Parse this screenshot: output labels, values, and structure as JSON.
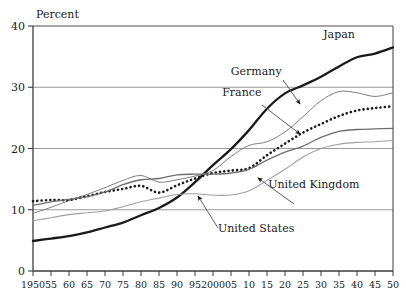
{
  "chart_data": {
    "type": "line",
    "title": "",
    "ylabel": "Percent",
    "xlabel": "",
    "ylim": [
      0,
      40
    ],
    "xlim": [
      1950,
      2050
    ],
    "yticks": [
      "0",
      "10",
      "20",
      "30",
      "40"
    ],
    "ytick_values": [
      0,
      10,
      20,
      30,
      40
    ],
    "grid": "horizontal gridlines at 10, 20, 30",
    "legend_position": "inline annotations with leader arrows",
    "xticks": [
      "1950",
      "55",
      "60",
      "65",
      "70",
      "75",
      "80",
      "85",
      "90",
      "95",
      "2000",
      "05",
      "10",
      "15",
      "20",
      "25",
      "30",
      "35",
      "40",
      "45",
      "50"
    ],
    "xtick_values": [
      1950,
      1955,
      1960,
      1965,
      1970,
      1975,
      1980,
      1985,
      1990,
      1995,
      2000,
      2005,
      2010,
      2015,
      2020,
      2025,
      2030,
      2035,
      2040,
      2045,
      2050
    ],
    "x": [
      1950,
      1955,
      1960,
      1965,
      1970,
      1975,
      1980,
      1985,
      1990,
      1995,
      2000,
      2005,
      2010,
      2015,
      2020,
      2025,
      2030,
      2035,
      2040,
      2045,
      2050
    ],
    "series": [
      {
        "name": "Japan",
        "style": "solid-thick-black",
        "color": "#1a1a1a",
        "values": [
          4.9,
          5.3,
          5.7,
          6.3,
          7.1,
          7.9,
          9.1,
          10.3,
          12.0,
          14.5,
          17.3,
          19.9,
          23.0,
          26.5,
          29.0,
          30.3,
          31.7,
          33.4,
          34.9,
          35.5,
          36.5
        ]
      },
      {
        "name": "Germany",
        "style": "solid-thin-gray",
        "color": "#808080",
        "values": [
          9.4,
          10.4,
          11.5,
          12.5,
          13.6,
          14.8,
          15.6,
          14.5,
          14.9,
          15.5,
          16.4,
          18.7,
          20.5,
          21.1,
          22.7,
          25.2,
          27.8,
          29.3,
          29.1,
          28.5,
          29.1
        ]
      },
      {
        "name": "France",
        "style": "dotted-black",
        "color": "#1a1a1a",
        "values": [
          11.4,
          11.6,
          11.6,
          12.2,
          12.9,
          13.4,
          13.9,
          12.8,
          14.0,
          15.1,
          16.0,
          16.4,
          16.8,
          18.9,
          20.8,
          22.6,
          24.0,
          25.3,
          26.2,
          26.6,
          26.9
        ]
      },
      {
        "name": "United Kingdom",
        "style": "solid-medium-gray",
        "color": "#6e6e6e",
        "values": [
          10.7,
          11.3,
          11.7,
          12.1,
          12.9,
          14.1,
          14.9,
          15.1,
          15.7,
          15.8,
          15.8,
          16.0,
          16.6,
          18.1,
          19.4,
          20.4,
          21.8,
          22.8,
          23.1,
          23.2,
          23.3
        ]
      },
      {
        "name": "United States",
        "style": "solid-light-gray",
        "color": "#a0a0a0",
        "values": [
          8.2,
          8.7,
          9.2,
          9.5,
          9.8,
          10.5,
          11.3,
          11.9,
          12.5,
          12.6,
          12.4,
          12.4,
          13.1,
          14.8,
          16.6,
          18.6,
          20.0,
          20.7,
          21.0,
          21.1,
          21.3
        ]
      }
    ],
    "annotations": [
      {
        "text": "Japan",
        "x": 2035,
        "y": 38.0
      },
      {
        "text": "Germany",
        "x": 2012,
        "y": 32.0
      },
      {
        "text": "France",
        "x": 2008,
        "y": 28.6
      },
      {
        "text": "United Kingdom",
        "x": 2028,
        "y": 13.6
      },
      {
        "text": "United States",
        "x": 2012,
        "y": 6.4
      }
    ]
  },
  "axis": {
    "percent_label": "Percent"
  }
}
